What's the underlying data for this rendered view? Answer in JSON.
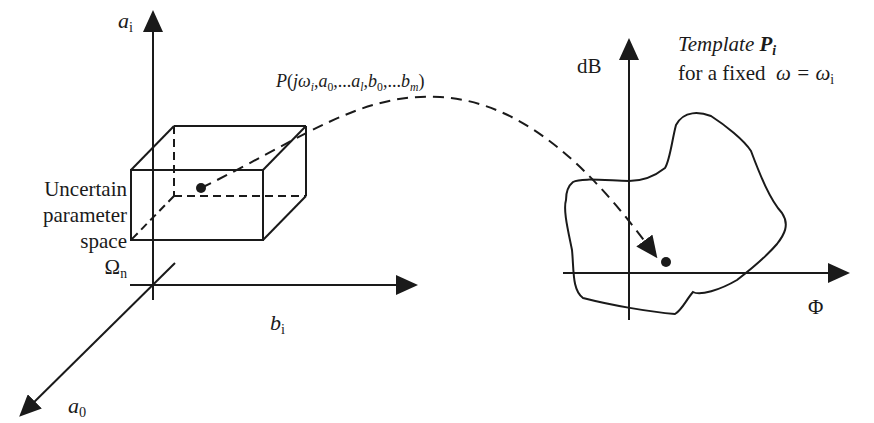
{
  "left_panel": {
    "title": "Uncertain parameter space",
    "label_lines": [
      "Uncertain",
      "parameter",
      "space"
    ],
    "space_symbol": "Ω",
    "space_subscript": "n",
    "axes": {
      "vertical": {
        "symbol": "a",
        "subscript": "i"
      },
      "horizontal": {
        "symbol": "b",
        "subscript": "i"
      },
      "depth": {
        "symbol": "a",
        "subscript": "0"
      }
    }
  },
  "mapping": {
    "function_label": "P(jω_i, a_0, ...a_l, b_0, ...b_m)",
    "parts": {
      "P": "P",
      "open": "(",
      "j": "j",
      "omega": "ω",
      "omega_sub": "i",
      "a": "a",
      "a0_sub": "0",
      "dots1": ",...",
      "al_sub": "l",
      "b": "b",
      "b0_sub": "0",
      "dots2": ",...",
      "bm_sub": "m",
      "comma": ",",
      "close": ")"
    }
  },
  "right_panel": {
    "title_word": "Template",
    "title_symbol": "P",
    "title_subscript": "i",
    "subtitle": "for a fixed",
    "omega_eq": "ω = ω",
    "omega_sub": "i",
    "axes": {
      "vertical": "dB",
      "horizontal": "Φ"
    }
  },
  "colors": {
    "stroke": "#1a1a1a",
    "background": "#ffffff"
  }
}
